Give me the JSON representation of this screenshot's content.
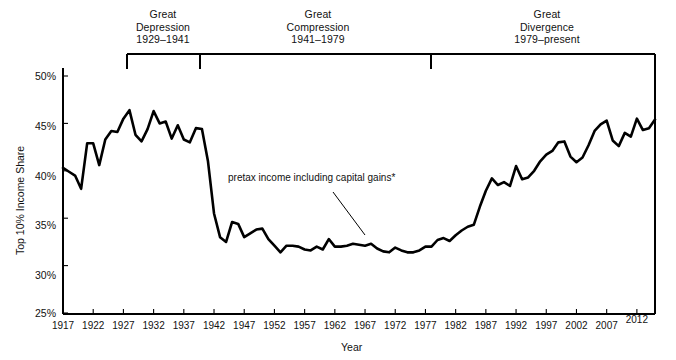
{
  "chart_data": {
    "type": "line",
    "title": "",
    "xlabel": "Year",
    "ylabel": "Top 10% Income Share",
    "xlim": [
      1917,
      2015
    ],
    "ylim": [
      25,
      50
    ],
    "grid": false,
    "legend": "none",
    "series_annotation": "pretax income including capital gains*",
    "xticks": [
      "1917",
      "1922",
      "1927",
      "1932",
      "1937",
      "1942",
      "1947",
      "1952",
      "1957",
      "1962",
      "1967",
      "1972",
      "1977",
      "1982",
      "1987",
      "1992",
      "1997",
      "2002",
      "2007",
      "2012"
    ],
    "xtick_values": [
      1917,
      1922,
      1927,
      1932,
      1937,
      1942,
      1947,
      1952,
      1957,
      1962,
      1967,
      1972,
      1977,
      1982,
      1987,
      1992,
      1997,
      2002,
      2007,
      2012
    ],
    "yticks": [
      "25%",
      "30%",
      "35%",
      "40%",
      "45%",
      "50%"
    ],
    "ytick_values": [
      25,
      30,
      35,
      40,
      45,
      50
    ],
    "line_color": "#000000",
    "series": [
      {
        "name": "pretax income including capital gains*",
        "x": [
          1917,
          1918,
          1919,
          1920,
          1921,
          1922,
          1923,
          1924,
          1925,
          1926,
          1927,
          1928,
          1929,
          1930,
          1931,
          1932,
          1933,
          1934,
          1935,
          1936,
          1937,
          1938,
          1939,
          1940,
          1941,
          1942,
          1943,
          1944,
          1945,
          1946,
          1947,
          1948,
          1949,
          1950,
          1951,
          1952,
          1953,
          1954,
          1955,
          1956,
          1957,
          1958,
          1959,
          1960,
          1961,
          1962,
          1963,
          1964,
          1965,
          1966,
          1967,
          1968,
          1969,
          1970,
          1971,
          1972,
          1973,
          1974,
          1975,
          1976,
          1977,
          1978,
          1979,
          1980,
          1981,
          1982,
          1983,
          1984,
          1985,
          1986,
          1987,
          1988,
          1989,
          1990,
          1991,
          1992,
          1993,
          1994,
          1995,
          1996,
          1997,
          1998,
          1999,
          2000,
          2001,
          2002,
          2003,
          2004,
          2005,
          2006,
          2007,
          2008,
          2009,
          2010,
          2011,
          2012,
          2013,
          2014,
          2015
        ],
        "y": [
          40.3,
          39.9,
          39.5,
          38.1,
          42.9,
          42.9,
          40.6,
          43.3,
          44.2,
          44.1,
          45.5,
          46.4,
          43.8,
          43.1,
          44.4,
          46.3,
          45.0,
          45.2,
          43.4,
          44.8,
          43.3,
          43.0,
          44.5,
          44.4,
          41.0,
          35.5,
          33.0,
          32.5,
          34.6,
          34.4,
          33.0,
          33.4,
          33.8,
          33.9,
          32.8,
          32.1,
          31.4,
          32.1,
          32.1,
          32.0,
          31.7,
          31.6,
          32.0,
          31.7,
          32.8,
          32.0,
          32.0,
          32.1,
          32.3,
          32.2,
          32.1,
          32.3,
          31.8,
          31.5,
          31.4,
          31.9,
          31.6,
          31.4,
          31.4,
          31.6,
          32.0,
          32.0,
          32.7,
          32.9,
          32.6,
          33.2,
          33.7,
          34.1,
          34.3,
          36.2,
          37.9,
          39.2,
          38.5,
          38.8,
          38.4,
          40.5,
          39.1,
          39.3,
          40.0,
          41.0,
          41.7,
          42.1,
          43.0,
          43.1,
          41.5,
          40.9,
          41.4,
          42.7,
          44.2,
          44.9,
          45.3,
          43.2,
          42.6,
          44.0,
          43.6,
          45.5,
          44.3,
          44.5,
          45.4
        ],
        "note": "Top 10% income share, percent"
      }
    ],
    "eras": [
      {
        "name": "Great Depression",
        "line1": "Great",
        "line2": "Depression",
        "line3": "1929–1941",
        "start_year": 1929,
        "end_year": 1941
      },
      {
        "name": "Great Compression",
        "line1": "Great",
        "line2": "Compression",
        "line3": "1941–1979",
        "start_year": 1941,
        "end_year": 1979
      },
      {
        "name": "Great Divergence",
        "line1": "Great",
        "line2": "Divergence",
        "line3": "1979–present",
        "start_year": 1979,
        "end_year": 2015
      }
    ]
  }
}
